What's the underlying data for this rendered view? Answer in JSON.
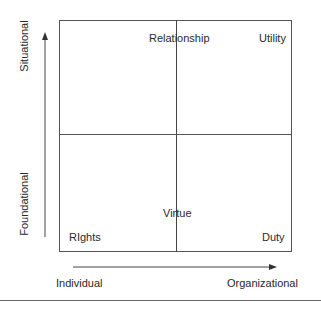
{
  "diagram": {
    "type": "2x2 quadrant matrix",
    "quadrants": {
      "top_left_center": "Relationship",
      "top_right": "Utility",
      "bottom_left": "RIghts",
      "bottom_center": "Virtue",
      "bottom_right": "Duty"
    },
    "y_axis": {
      "top_label": "Situational",
      "bottom_label": "Foundational",
      "direction": "up"
    },
    "x_axis": {
      "left_label": "Individual",
      "right_label": "Organizational",
      "direction": "right"
    },
    "colors": {
      "lines": "#555555",
      "text": "#2a2a2a",
      "background": "#ffffff"
    }
  }
}
